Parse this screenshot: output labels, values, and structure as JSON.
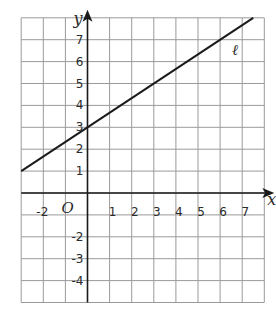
{
  "chart_data": {
    "type": "line",
    "title": "",
    "xlabel": "x",
    "ylabel": "y",
    "origin_label": "𝒪",
    "xlim": [
      -3,
      8
    ],
    "ylim": [
      -5,
      8
    ],
    "grid": true,
    "x_ticks": [
      -2,
      1,
      2,
      3,
      4,
      5,
      6,
      7
    ],
    "y_ticks": [
      7,
      6,
      5,
      4,
      3,
      2,
      1,
      -2,
      -3,
      -4
    ],
    "series": [
      {
        "name": "ℓ",
        "equation": "y = (2/3)x + 3",
        "slope": 0.6667,
        "intercept": 3,
        "points": [
          [
            -3,
            1
          ],
          [
            0,
            3
          ],
          [
            3,
            5
          ],
          [
            6,
            7
          ],
          [
            7.5,
            8
          ]
        ]
      }
    ],
    "annotations": [
      {
        "text": "ℓ",
        "x": 6.5,
        "y": 6.5
      }
    ]
  }
}
